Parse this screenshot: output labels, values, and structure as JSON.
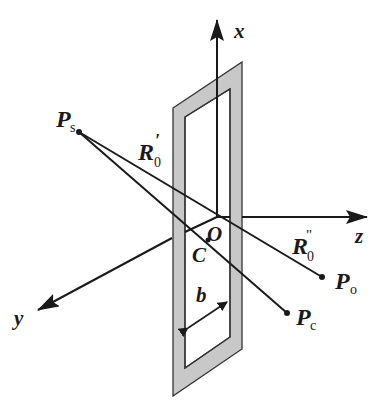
{
  "figure": {
    "colors": {
      "line": "#1a1a1a",
      "frame_fill": "#c8c8c8",
      "frame_edge": "#333333",
      "background": "#ffffff"
    },
    "axes": {
      "x": {
        "label": "x"
      },
      "y": {
        "label": "y"
      },
      "z": {
        "label": "z"
      }
    },
    "points": {
      "origin": {
        "label": "O"
      },
      "center": {
        "label": "C"
      },
      "source": {
        "main": "P",
        "sub": "s"
      },
      "observation": {
        "main": "P",
        "sub": "o"
      },
      "center_point": {
        "main": "P",
        "sub": "c"
      }
    },
    "distances": {
      "r0_prime": {
        "main": "R",
        "sub": "0",
        "mark": "′"
      },
      "r0_double_prime": {
        "main": "R",
        "sub": "0",
        "mark": "\""
      }
    },
    "dimension": {
      "width_label": "b"
    }
  }
}
